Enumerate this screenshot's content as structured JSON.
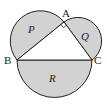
{
  "diagram": {
    "colors": {
      "fill": "#d2d2d2",
      "stroke": "#222222",
      "background": "#ffffff"
    },
    "points": {
      "A": {
        "label": "A",
        "x": 64,
        "y": 22
      },
      "B": {
        "label": "B",
        "x": 17,
        "y": 60
      },
      "C": {
        "label": "C",
        "x": 92,
        "y": 60
      }
    },
    "regions": {
      "P": {
        "label": "P"
      },
      "Q": {
        "label": "Q"
      },
      "R": {
        "label": "R"
      }
    },
    "right_angle_at": "A"
  }
}
